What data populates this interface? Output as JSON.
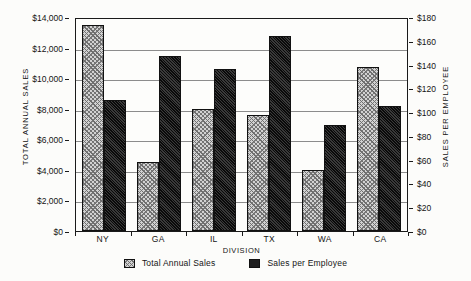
{
  "chart_data": {
    "type": "bar",
    "title": "",
    "categories": [
      "NY",
      "GA",
      "IL",
      "TX",
      "WA",
      "CA"
    ],
    "xlabel": "DIVISION",
    "series": [
      {
        "name": "Total Annual Sales",
        "axis": "left",
        "values": [
          13500,
          4500,
          8000,
          7600,
          4000,
          10750
        ],
        "style": "light-hatched"
      },
      {
        "name": "Sales per Employee",
        "axis": "right",
        "values": [
          110,
          147,
          136,
          164,
          89,
          105
        ],
        "style": "dark-solid"
      }
    ],
    "left_axis": {
      "label": "TOTAL ANNUAL SALES",
      "ylim": [
        0,
        14000
      ],
      "tick_step": 2000,
      "ticks": [
        "$0",
        "$2,000",
        "$4,000",
        "$6,000",
        "$8,000",
        "$10,000",
        "$12,000",
        "$14,000"
      ]
    },
    "right_axis": {
      "label": "SALES PER EMPLOYEE",
      "ylim": [
        0,
        180
      ],
      "tick_step": 20,
      "ticks": [
        "$0",
        "$20",
        "$40",
        "$60",
        "$80",
        "$100",
        "$120",
        "$140",
        "$160",
        "$180"
      ]
    },
    "grid": true,
    "legend_position": "bottom",
    "legend": [
      {
        "label": "Total Annual Sales",
        "swatch": "light-hatched"
      },
      {
        "label": "Sales per Employee",
        "swatch": "dark-solid"
      }
    ],
    "colors": {
      "light_bar": "#d2d2d2",
      "dark_bar": "#2a2a2a",
      "axis": "#1a1a1a",
      "grid": "#8c8c8c",
      "background": "#fdfdfb"
    }
  }
}
